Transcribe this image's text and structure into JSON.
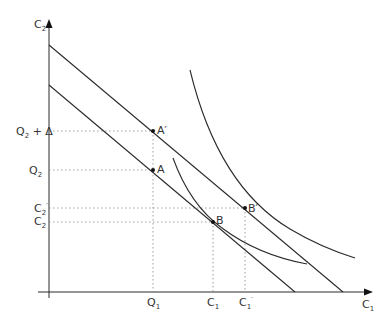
{
  "axes": {
    "y_label": "C",
    "y_sub": "2",
    "x_label": "C",
    "x_sub": "1"
  },
  "y_ticks": {
    "q2_delta": {
      "main": "Q",
      "sub": "2",
      "suffix": " + Δ"
    },
    "q2": {
      "main": "Q",
      "sub": "2"
    },
    "c2_prime": {
      "main": "C",
      "sub": "2",
      "prime": "′"
    },
    "c2": {
      "main": "C",
      "sub": "2"
    }
  },
  "x_ticks": {
    "q1": {
      "main": "Q",
      "sub": "1"
    },
    "c1": {
      "main": "C",
      "sub": "1"
    },
    "c1_prime": {
      "main": "C",
      "sub": "1",
      "prime": "′"
    }
  },
  "points": {
    "a": "A",
    "a_prime": "A′",
    "b": "B",
    "b_prime": "B′"
  },
  "colors": {
    "line": "#2b2b2b",
    "guide": "#777777"
  }
}
